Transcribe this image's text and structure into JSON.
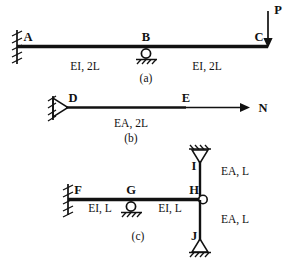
{
  "figure": {
    "background_color": "#ffffff",
    "ink_color": "#111111"
  },
  "diagrams": [
    {
      "id": "a",
      "caption": "(a)",
      "type": "continuous-beam",
      "nodes": [
        {
          "label": "A",
          "support": "fixed"
        },
        {
          "label": "B",
          "support": "roller"
        },
        {
          "label": "C",
          "support": "free"
        }
      ],
      "spans": [
        {
          "from": "A",
          "to": "B",
          "property": "EI, 2L"
        },
        {
          "from": "B",
          "to": "C",
          "property": "EI, 2L"
        }
      ],
      "loads": [
        {
          "label": "P",
          "at": "C",
          "direction": "down",
          "type": "point-force"
        }
      ]
    },
    {
      "id": "b",
      "caption": "(b)",
      "type": "axial-bar",
      "nodes": [
        {
          "label": "D",
          "support": "pin"
        },
        {
          "label": "E",
          "support": "free"
        }
      ],
      "spans": [
        {
          "from": "D",
          "to": "E",
          "property": "EA, 2L"
        }
      ],
      "loads": [
        {
          "label": "N",
          "at": "E",
          "direction": "right",
          "type": "axial-force"
        }
      ]
    },
    {
      "id": "c",
      "caption": "(c)",
      "type": "beam-with-axial-bars",
      "nodes": [
        {
          "label": "F",
          "support": "fixed"
        },
        {
          "label": "G",
          "support": "roller"
        },
        {
          "label": "H",
          "support": "joint"
        },
        {
          "label": "I",
          "support": "pin"
        },
        {
          "label": "J",
          "support": "pin"
        }
      ],
      "spans": [
        {
          "from": "F",
          "to": "G",
          "property": "EI, L"
        },
        {
          "from": "G",
          "to": "H",
          "property": "EI, L"
        },
        {
          "from": "H",
          "to": "I",
          "property": "EA, L"
        },
        {
          "from": "H",
          "to": "J",
          "property": "EA, L"
        }
      ],
      "loads": []
    }
  ],
  "labels": {
    "a_point_A": "A",
    "a_point_B": "B",
    "a_point_C": "C",
    "a_span_left": "EI, 2L",
    "a_span_right": "EI, 2L",
    "a_load_P": "P",
    "a_caption": "(a)",
    "b_point_D": "D",
    "b_point_E": "E",
    "b_span": "EA, 2L",
    "b_load_N": "N",
    "b_caption": "(b)",
    "c_point_F": "F",
    "c_point_G": "G",
    "c_point_H": "H",
    "c_point_I": "I",
    "c_point_J": "J",
    "c_span_left": "EI, L",
    "c_span_right": "EI, L",
    "c_bar_upper": "EA, L",
    "c_bar_lower": "EA, L",
    "c_caption": "(c)"
  }
}
